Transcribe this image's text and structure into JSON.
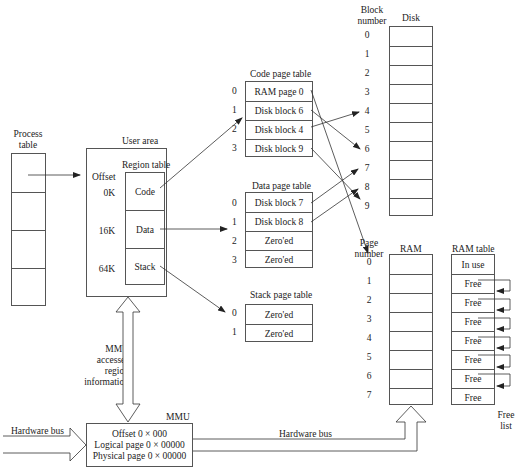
{
  "process_table": {
    "title_line1": "Process",
    "title_line2": "table",
    "rows": 4
  },
  "user_area": {
    "title": "User area",
    "region_table_title": "Region table",
    "offset_header": "Offset",
    "regions": [
      {
        "offset": "0K",
        "name": "Code"
      },
      {
        "offset": "16K",
        "name": "Data"
      },
      {
        "offset": "64K",
        "name": "Stack"
      }
    ]
  },
  "code_page_table": {
    "title": "Code page table",
    "rows": [
      {
        "index": "0",
        "value": "RAM page 0"
      },
      {
        "index": "1",
        "value": "Disk block 6"
      },
      {
        "index": "2",
        "value": "Disk block 4"
      },
      {
        "index": "3",
        "value": "Disk block 9"
      }
    ]
  },
  "data_page_table": {
    "title": "Data page table",
    "rows": [
      {
        "index": "0",
        "value": "Disk block 7"
      },
      {
        "index": "1",
        "value": "Disk block 8"
      },
      {
        "index": "2",
        "value": "Zero'ed"
      },
      {
        "index": "3",
        "value": "Zero'ed"
      }
    ]
  },
  "stack_page_table": {
    "title": "Stack page table",
    "rows": [
      {
        "index": "0",
        "value": "Zero'ed"
      },
      {
        "index": "1",
        "value": "Zero'ed"
      }
    ]
  },
  "disk": {
    "title": "Disk",
    "number_header_line1": "Block",
    "number_header_line2": "number",
    "blocks": [
      "0",
      "1",
      "2",
      "3",
      "4",
      "5",
      "6",
      "7",
      "8",
      "9"
    ]
  },
  "ram": {
    "title": "RAM",
    "number_header_line1": "Page",
    "number_header_line2": "number",
    "pages": [
      "0",
      "1",
      "2",
      "3",
      "4",
      "5",
      "6",
      "7"
    ]
  },
  "ram_table": {
    "title": "RAM table",
    "rows": [
      "In use",
      "Free",
      "Free",
      "Free",
      "Free",
      "Free",
      "Free",
      "Free"
    ],
    "free_list_line1": "Free",
    "free_list_line2": "list"
  },
  "mmu": {
    "title": "MMU",
    "access_label": [
      "MMU",
      "accesses",
      "region",
      "information"
    ],
    "offset": "Offset 0 × 000",
    "logical_page": "Logical page 0 × 00000",
    "physical_page": "Physical page 0 × 00000"
  },
  "hardware_bus_in": {
    "label": "Hardware bus",
    "value": "0 × 00000000"
  },
  "hardware_bus_out": {
    "label": "Hardware bus",
    "value": "0 × 00000000"
  }
}
